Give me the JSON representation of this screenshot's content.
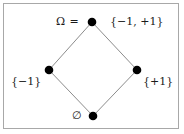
{
  "figure": {
    "background_color": "#ffffff",
    "frame_color": "#a8a8a8",
    "edge_color": "#8c8c8c",
    "node_color": "#000000"
  },
  "nodes": {
    "top": {
      "prefix_label": "Ω =",
      "set_label": "{−1, +1}",
      "x": 92,
      "y": 22
    },
    "left": {
      "set_label": "{−1}",
      "x": 49,
      "y": 70
    },
    "right": {
      "set_label": "{+1}",
      "x": 137,
      "y": 70
    },
    "bottom": {
      "set_label": "∅",
      "x": 93,
      "y": 116
    }
  },
  "edges": [
    {
      "from": "top",
      "to": "left"
    },
    {
      "from": "top",
      "to": "right"
    },
    {
      "from": "left",
      "to": "bottom"
    },
    {
      "from": "right",
      "to": "bottom"
    }
  ]
}
